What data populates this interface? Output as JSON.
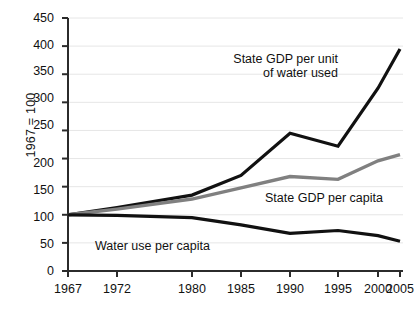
{
  "chart_data": {
    "type": "line",
    "title": "",
    "xlabel": "",
    "ylabel": "1967 = 100",
    "categories": [
      "1967",
      "1972",
      "1980",
      "1985",
      "1990",
      "1995",
      "2000",
      "2005"
    ],
    "ylim": [
      0,
      450
    ],
    "ytick_labels": [
      "0",
      "50",
      "100",
      "150",
      "200",
      "250",
      "300",
      "350",
      "400",
      "450"
    ],
    "ytick_values": [
      0,
      50,
      100,
      150,
      200,
      250,
      300,
      350,
      400,
      450
    ],
    "grid": "horizontal",
    "legend": "inline-annotations",
    "series": [
      {
        "name": "State GDP per unit of water used",
        "color": "#111111",
        "values": [
          100,
          113,
          135,
          170,
          245,
          222,
          325,
          395
        ]
      },
      {
        "name": "State GDP per capita",
        "color": "#808080",
        "values": [
          100,
          110,
          128,
          148,
          168,
          163,
          196,
          207
        ]
      },
      {
        "name": "Water use per capita",
        "color": "#111111",
        "values": [
          100,
          99,
          95,
          82,
          67,
          72,
          63,
          53
        ]
      }
    ],
    "annotations": [
      {
        "text_line1": "State GDP per unit",
        "text_line2": "of water used"
      },
      {
        "text_line1": "State GDP per capita",
        "text_line2": ""
      },
      {
        "text_line1": "Water use per capita",
        "text_line2": ""
      }
    ]
  }
}
